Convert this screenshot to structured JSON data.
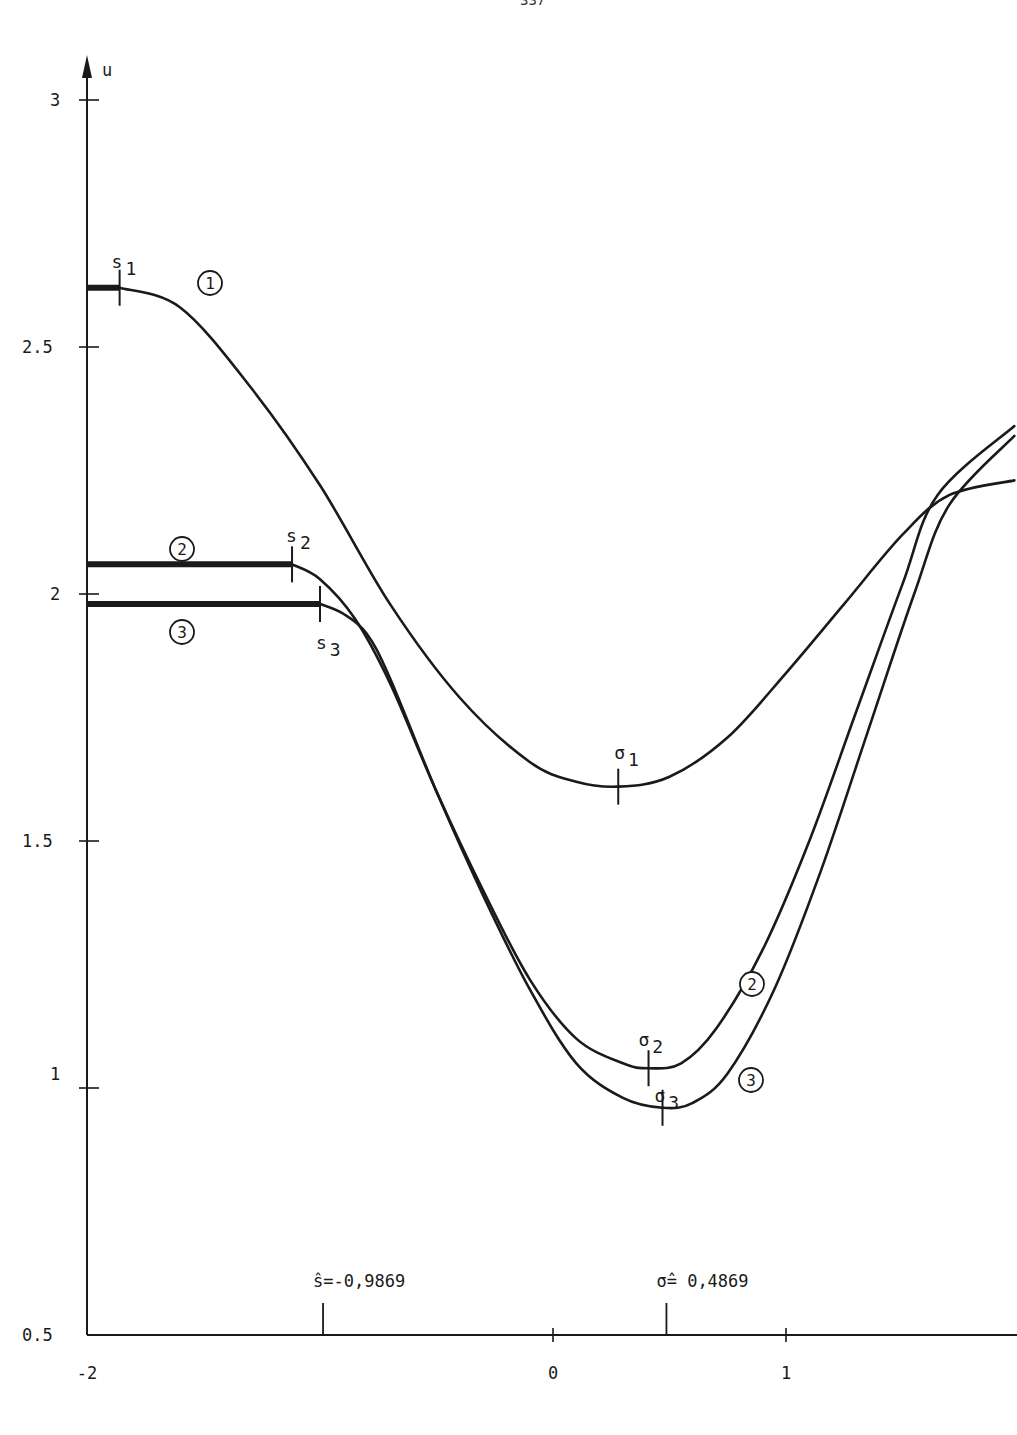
{
  "page": {
    "number_fragment": "337"
  },
  "chart_data": {
    "type": "line",
    "title": "",
    "xlabel": "",
    "ylabel": "u",
    "xlim": [
      -2,
      2
    ],
    "ylim": [
      0.5,
      3.1
    ],
    "grid": false,
    "x_ticks": [
      {
        "value": -2,
        "label": "-2"
      },
      {
        "value": 0,
        "label": "0"
      },
      {
        "value": 1,
        "label": "1"
      }
    ],
    "y_ticks": [
      {
        "value": 3,
        "label": "3"
      },
      {
        "value": 2.5,
        "label": "2.5"
      },
      {
        "value": 2,
        "label": "2"
      },
      {
        "value": 1.5,
        "label": "1.5"
      },
      {
        "value": 1,
        "label": "1"
      },
      {
        "value": 0.5,
        "label": "0.5"
      }
    ],
    "x_markers": [
      {
        "value": -0.9869,
        "label": "ŝ=-0,9869"
      },
      {
        "value": 0.4869,
        "label": "σ̂= 0,4869"
      }
    ],
    "series": [
      {
        "name": "1",
        "label": "①",
        "flat_until": -1.86,
        "points": [
          [
            -2,
            2.62
          ],
          [
            -1.86,
            2.62
          ],
          [
            -1.6,
            2.58
          ],
          [
            -1.3,
            2.42
          ],
          [
            -1.0,
            2.22
          ],
          [
            -0.7,
            1.98
          ],
          [
            -0.4,
            1.79
          ],
          [
            -0.1,
            1.66
          ],
          [
            0.1,
            1.62
          ],
          [
            0.28,
            1.61
          ],
          [
            0.5,
            1.63
          ],
          [
            0.75,
            1.71
          ],
          [
            1.0,
            1.84
          ],
          [
            1.25,
            1.98
          ],
          [
            1.5,
            2.12
          ],
          [
            1.7,
            2.2
          ],
          [
            1.98,
            2.23
          ]
        ],
        "markers": [
          {
            "name": "s1",
            "x": -1.86,
            "u": 2.62
          },
          {
            "name": "σ1",
            "x": 0.28,
            "u": 1.61
          }
        ]
      },
      {
        "name": "2",
        "label": "②",
        "flat_until": -1.12,
        "points": [
          [
            -2,
            2.06
          ],
          [
            -1.12,
            2.06
          ],
          [
            -1.0,
            2.03
          ],
          [
            -0.85,
            1.95
          ],
          [
            -0.7,
            1.82
          ],
          [
            -0.5,
            1.6
          ],
          [
            -0.3,
            1.4
          ],
          [
            -0.1,
            1.22
          ],
          [
            0.1,
            1.1
          ],
          [
            0.3,
            1.05
          ],
          [
            0.41,
            1.04
          ],
          [
            0.55,
            1.05
          ],
          [
            0.7,
            1.12
          ],
          [
            0.9,
            1.28
          ],
          [
            1.1,
            1.5
          ],
          [
            1.3,
            1.76
          ],
          [
            1.5,
            2.02
          ],
          [
            1.65,
            2.2
          ],
          [
            1.98,
            2.34
          ]
        ],
        "markers": [
          {
            "name": "s2",
            "x": -1.12,
            "u": 2.06
          },
          {
            "name": "σ2",
            "x": 0.41,
            "u": 1.04
          }
        ]
      },
      {
        "name": "3",
        "label": "③",
        "flat_until": -1.0,
        "points": [
          [
            -2,
            1.98
          ],
          [
            -1.0,
            1.98
          ],
          [
            -0.9,
            1.96
          ],
          [
            -0.8,
            1.92
          ],
          [
            -0.7,
            1.83
          ],
          [
            -0.5,
            1.6
          ],
          [
            -0.3,
            1.39
          ],
          [
            -0.1,
            1.2
          ],
          [
            0.1,
            1.05
          ],
          [
            0.3,
            0.98
          ],
          [
            0.47,
            0.96
          ],
          [
            0.6,
            0.97
          ],
          [
            0.75,
            1.03
          ],
          [
            0.95,
            1.2
          ],
          [
            1.15,
            1.44
          ],
          [
            1.35,
            1.72
          ],
          [
            1.55,
            2.0
          ],
          [
            1.7,
            2.18
          ],
          [
            1.98,
            2.32
          ]
        ],
        "markers": [
          {
            "name": "s3",
            "x": -1.0,
            "u": 1.98
          },
          {
            "name": "σ3",
            "x": 0.47,
            "u": 0.96
          }
        ]
      }
    ],
    "annotations": [
      {
        "text": "s1",
        "near": "curve 1 start"
      },
      {
        "text": "s2",
        "near": "curve 2 plateau end"
      },
      {
        "text": "s3",
        "near": "curve 3 plateau end"
      },
      {
        "text": "σ1",
        "near": "curve 1 minimum"
      },
      {
        "text": "σ2",
        "near": "curve 2 minimum"
      },
      {
        "text": "σ3",
        "near": "curve 3 minimum"
      }
    ]
  }
}
